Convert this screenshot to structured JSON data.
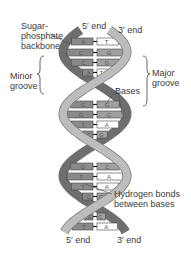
{
  "diagram": {
    "labels": {
      "backbone": "Sugar-\nphosphate\nbackbone",
      "five_prime_top": "5′ end",
      "three_prime_top": "3′ end",
      "minor_groove": "Minor\ngroove",
      "major_groove": "Major\ngroove",
      "bases": "Bases",
      "hydrogen_bonds": "Hydrogen bonds\nbetween bases",
      "five_prime_bottom": "5′ end",
      "three_prime_bottom": "3′ end"
    },
    "base_pairs": [
      {
        "y": 41,
        "left": "A",
        "right": "T"
      },
      {
        "y": 52,
        "left": "C",
        "right": "G"
      },
      {
        "y": 62,
        "left": "C",
        "right": "G"
      },
      {
        "y": 72,
        "left": "A",
        "right": "T"
      },
      {
        "y": 104,
        "left": "C",
        "right": "G"
      },
      {
        "y": 114,
        "left": "G",
        "right": "C"
      },
      {
        "y": 124,
        "left": "T",
        "right": "A"
      },
      {
        "y": 134,
        "left": "C",
        "right": "G"
      },
      {
        "y": 166,
        "left": "G",
        "right": "C"
      },
      {
        "y": 176,
        "left": "T",
        "right": "A"
      },
      {
        "y": 186,
        "left": "T",
        "right": "A"
      },
      {
        "y": 196,
        "left": "C",
        "right": "G"
      },
      {
        "y": 216,
        "left": "G",
        "right": "C"
      },
      {
        "y": 226,
        "left": "T",
        "right": "A"
      }
    ],
    "colors": {
      "strand_light": "#bdbdbd",
      "strand_dark": "#6e6e6e",
      "base_dark": "#8a8a8a",
      "base_light": "#ffffff",
      "text": "#3a3a3a"
    }
  }
}
